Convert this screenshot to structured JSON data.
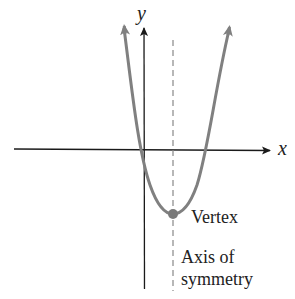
{
  "diagram": {
    "labels": {
      "y_axis": "y",
      "x_axis": "x",
      "vertex": "Vertex",
      "axis_line1": "Axis of",
      "axis_line2": "symmetry"
    },
    "colors": {
      "curve": "#808080",
      "axes": "#1a1a1a",
      "dashed": "#888888",
      "vertex_dot": "#7a7a7a"
    },
    "geometry": {
      "origin_px": [
        144,
        149
      ],
      "vertex_px": [
        173,
        214
      ],
      "x_intercepts_px": [
        143,
        204
      ],
      "axis_of_symmetry_x_px": 173
    }
  }
}
